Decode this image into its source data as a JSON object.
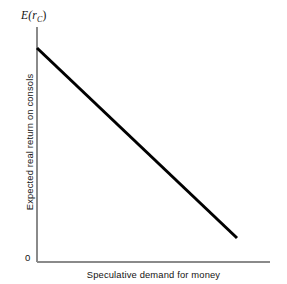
{
  "figure": {
    "background_color": "#ffffff",
    "width": 287,
    "height": 284
  },
  "labels": {
    "y_axis_top_prefix": "E(",
    "y_axis_top_var": "r",
    "y_axis_top_subscript": "C",
    "y_axis_top_suffix": ")",
    "y_axis_title": "Expected real return on consols",
    "x_axis_title": "Speculative demand for money",
    "origin": "0"
  },
  "chart_data": {
    "type": "line",
    "title": "",
    "subtitle": "",
    "xlabel": "Speculative demand for money",
    "ylabel": "Expected real return on consols",
    "y_axis_symbol": "E(r_C)",
    "origin_label": "0",
    "grid": false,
    "legend": false,
    "legend_position": "none",
    "xlim": [
      0,
      1
    ],
    "ylim": [
      0,
      1
    ],
    "axis_tick_labels": {
      "x": [],
      "y": []
    },
    "annotations": [],
    "series": [
      {
        "name": "Speculative money demand schedule",
        "description": "Downward-sloping straight line: higher expected real return on consols is associated with lower speculative demand for money.",
        "line_color": "#000000",
        "line_width_px": 3,
        "x": [
          0.0,
          0.858
        ],
        "y": [
          0.911,
          0.102
        ],
        "points_px": [
          {
            "x": 37,
            "y": 48
          },
          {
            "x": 237,
            "y": 238
          }
        ]
      }
    ],
    "axes_geometry_px": {
      "y_axis_x": 37,
      "y_axis_top": 27,
      "y_axis_bottom": 262,
      "x_axis_y": 262,
      "x_axis_left": 37,
      "x_axis_right": 270,
      "axis_color": "#8a8a8a",
      "axis_width_px": 1
    }
  }
}
